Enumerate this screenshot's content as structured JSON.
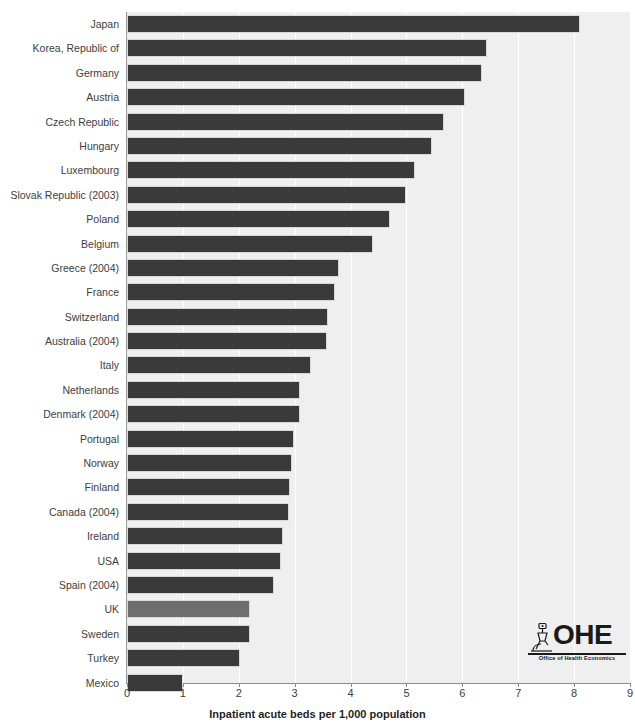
{
  "chart_data": {
    "type": "bar",
    "orientation": "horizontal",
    "title": "",
    "xlabel": "Inpatient acute beds per 1,000 population",
    "ylabel": "",
    "xlim": [
      0,
      9
    ],
    "xticks": [
      0,
      1,
      2,
      3,
      4,
      5,
      6,
      7,
      8,
      9
    ],
    "xtick_labels": [
      "0",
      "1",
      "2",
      "3",
      "4",
      "5",
      "6",
      "7",
      "8",
      "9"
    ],
    "grid": true,
    "grid_axis": "x",
    "legend": null,
    "categories": [
      "Japan",
      "Korea, Republic of",
      "Germany",
      "Austria",
      "Czech Republic",
      "Hungary",
      "Luxembourg",
      "Slovak Republic (2003)",
      "Poland",
      "Belgium",
      "Greece (2004)",
      "France",
      "Switzerland",
      "Australia (2004)",
      "Italy",
      "Netherlands",
      "Denmark (2004)",
      "Portugal",
      "Norway",
      "Finland",
      "Canada (2004)",
      "Ireland",
      "USA",
      "Spain (2004)",
      "UK",
      "Sweden",
      "Turkey",
      "Mexico"
    ],
    "values": [
      8.1,
      6.45,
      6.35,
      6.05,
      5.67,
      5.45,
      5.15,
      5.0,
      4.7,
      4.4,
      3.8,
      3.73,
      3.6,
      3.58,
      3.3,
      3.1,
      3.1,
      2.98,
      2.95,
      2.92,
      2.9,
      2.8,
      2.75,
      2.63,
      2.2,
      2.2,
      2.03,
      1.0
    ],
    "highlight_category": "UK",
    "bar_color": "#3a3a3a",
    "highlight_color": "#6e6e6e",
    "plot_background": "#efefef"
  },
  "logo": {
    "name": "ohe-logo",
    "wordmark": "OHE",
    "tagline": "Office of Health Economics",
    "mark_icon": "microscope-icon"
  }
}
